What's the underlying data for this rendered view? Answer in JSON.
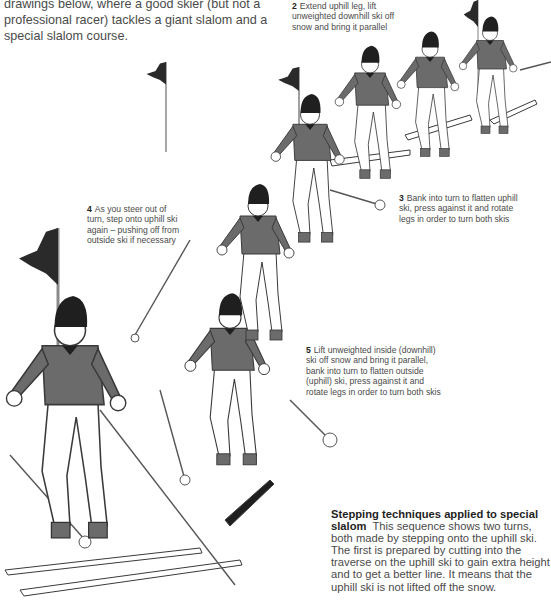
{
  "intro_text": "drawings below, where a good skier (but not a professional racer) tackles a giant slalom and a special slalom course.",
  "captions": [
    {
      "number": "2",
      "text": "Extend uphill leg, lift unweighted downhill ski off snow and bring it parallel"
    },
    {
      "number": "3",
      "text": "Bank into turn to flatten uphill ski, press against it and rotate legs in order to turn both skis"
    },
    {
      "number": "4",
      "text": "As you steer out of turn, step onto uphill ski again – pushing off from outside ski if necessary"
    },
    {
      "number": "5",
      "text": "Lift unweighted inside (downhill) ski off snow and bring it parallel, bank into turn to flatten outside (uphill) ski, press against it and rotate legs in order to turn both skis"
    }
  ],
  "sidebar_box": {
    "title": "Stepping techniques applied to special slalom",
    "body": "This sequence shows two turns, both made by stepping onto the uphill ski. The first is prepared by cutting into the traverse on the uphill ski to gain extra height and to get a better line. It means that the uphill ski is not lifted off the snow."
  },
  "illustration": {
    "subject": "skier performing stepping turns through slalom gates",
    "figures": 7,
    "flags": 4,
    "colors": {
      "sweater": "#6b6b6b",
      "hat": "#1f1f1f",
      "flag": "#2a2a2a",
      "outline": "#3a3a3a",
      "pants": "#ffffff"
    }
  }
}
